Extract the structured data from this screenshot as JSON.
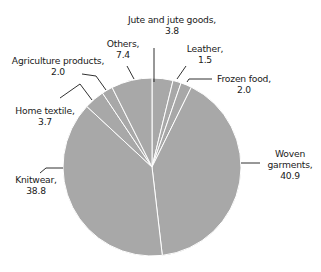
{
  "chart_data": {
    "type": "pie",
    "title": "",
    "start_angle_deg": 0,
    "direction": "clockwise",
    "slice_color": "#a8a8a8",
    "separator_color": "#ffffff",
    "label_line_color": "#1a1a1a",
    "categories": [
      "Jute and jute goods",
      "Leather",
      "Frozen food",
      "Woven garments",
      "Knitwear",
      "Home textile",
      "Agriculture products",
      "Others"
    ],
    "values": [
      3.8,
      1.5,
      2.0,
      40.9,
      38.8,
      3.7,
      2.0,
      7.4
    ],
    "labels": [
      {
        "name": "Jute and jute goods,",
        "value": "3.8"
      },
      {
        "name": "Leather,",
        "value": "1.5"
      },
      {
        "name": "Frozen food,",
        "value": "2.0"
      },
      {
        "name": "Woven",
        "name2": "garments,",
        "value": "40.9"
      },
      {
        "name": "Knitwear,",
        "value": "38.8"
      },
      {
        "name": "Home textile,",
        "value": "3.7"
      },
      {
        "name": "Agriculture products,",
        "value": "2.0"
      },
      {
        "name": "Others,",
        "value": "7.4"
      }
    ],
    "legend": "none (direct labels with leader lines)"
  }
}
